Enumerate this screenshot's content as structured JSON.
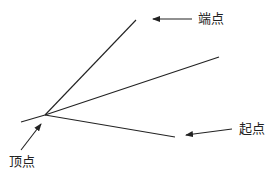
{
  "diagram": {
    "title": "",
    "line_color": "#222222",
    "background": "#ffffff",
    "labels": {
      "endpoint": "端点",
      "startpoint": "起点",
      "vertex": "顶点"
    },
    "geometry": {
      "vertex": [
        45,
        115
      ],
      "tail_end": [
        21,
        122
      ],
      "upper_ray_end": [
        136,
        20
      ],
      "middle_ray_end": [
        219,
        57
      ],
      "lower_ray_end": [
        175,
        137
      ]
    },
    "arrows": [
      {
        "name": "endpoint-arrow",
        "from": [
          192,
          19
        ],
        "to": [
          153,
          19
        ]
      },
      {
        "name": "startpoint-arrow",
        "from": [
          232,
          129
        ],
        "to": [
          186,
          135
        ]
      },
      {
        "name": "vertex-arrow",
        "from": [
          21,
          150
        ],
        "to": [
          41,
          124
        ]
      }
    ]
  }
}
